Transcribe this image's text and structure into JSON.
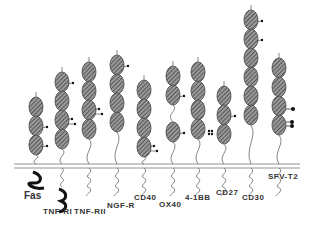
{
  "diagram": {
    "membrane": {
      "y1": 164,
      "y2": 168,
      "x1": 14,
      "x2": 300
    },
    "receptors": [
      {
        "name": "Fas",
        "x": 36,
        "top": 97,
        "domains": 3,
        "gap_after": null,
        "dots": [
          [
            1,
            "r"
          ],
          [
            2,
            "r"
          ]
        ],
        "tail": "thick",
        "label_x": 24,
        "label_y": 198
      },
      {
        "name": "TNF-RI",
        "x": 62,
        "top": 72,
        "domains": 4,
        "gap_after": null,
        "dots": [
          [
            0,
            "r"
          ],
          [
            2,
            "r2"
          ]
        ],
        "tail": "thick-long",
        "label_x": 44,
        "label_y": 213
      },
      {
        "name": "TNF-RII",
        "x": 89,
        "top": 62,
        "domains": 4,
        "gap_after": null,
        "dots": [
          [
            2,
            "r2"
          ]
        ],
        "tail": "thin",
        "label_x": 74,
        "label_y": 213
      },
      {
        "name": "NGF-R",
        "x": 117,
        "top": 55,
        "domains": 4,
        "gap_after": null,
        "dots": [
          [
            0,
            "r"
          ]
        ],
        "tail": "thin",
        "label_x": 107,
        "label_y": 207
      },
      {
        "name": "CD40",
        "x": 144,
        "top": 80,
        "domains": 4,
        "gap_after": null,
        "dots": [
          [
            3,
            "r2"
          ]
        ],
        "tail": "thin",
        "label_x": 134,
        "label_y": 198
      },
      {
        "name": "OX40",
        "x": 173,
        "top": 66,
        "domains": 3,
        "gap_after": 1,
        "dots": [
          [
            1,
            "r"
          ],
          [
            2,
            "r"
          ]
        ],
        "tail": "thin",
        "label_x": 159,
        "label_y": 205
      },
      {
        "name": "4-1BB",
        "x": 198,
        "top": 62,
        "domains": 4,
        "gap_after": null,
        "dots": [
          [
            3,
            "r3"
          ]
        ],
        "tail": "thin",
        "label_x": 186,
        "label_y": 198
      },
      {
        "name": "CD27",
        "x": 224,
        "top": 86,
        "domains": 3,
        "gap_after": null,
        "dots": [
          [
            1,
            "r"
          ]
        ],
        "tail": "thin",
        "label_x": 216,
        "label_y": 193
      },
      {
        "name": "CD30",
        "x": 251,
        "top": 10,
        "domains": 6,
        "gap_after": null,
        "dots": [
          [
            0,
            "r"
          ],
          [
            1,
            "r"
          ]
        ],
        "tail": "thin",
        "label_x": 242,
        "label_y": 198
      },
      {
        "name": "SFV-T2",
        "x": 279,
        "top": 58,
        "domains": 4,
        "gap_after": null,
        "dots": [
          [
            2,
            "big1"
          ],
          [
            3,
            "big2"
          ]
        ],
        "tail": "thin",
        "label_x": 268,
        "label_y": 177
      }
    ]
  },
  "labels": {
    "fas": "Fas",
    "tnfri": "TNF-RI",
    "tnfrii": "TNF-RII",
    "ngfr": "NGF-R",
    "cd40": "CD40",
    "ox40": "OX40",
    "bb": "4-1BB",
    "cd27": "CD27",
    "cd30": "CD30",
    "sfvt2": "SFV-T2"
  }
}
